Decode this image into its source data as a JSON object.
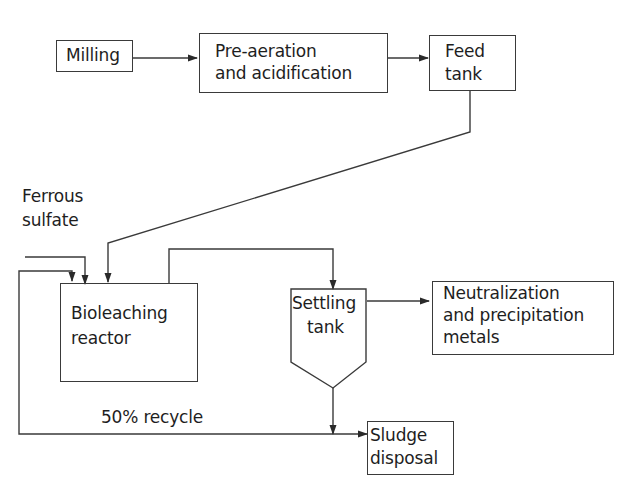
{
  "diagram": {
    "type": "process-flowchart",
    "nodes": [
      {
        "id": "milling",
        "lines": [
          "Milling"
        ]
      },
      {
        "id": "pre_aeration",
        "lines": [
          "Pre-aeration",
          "and acidification"
        ]
      },
      {
        "id": "feed_tank",
        "lines": [
          "Feed",
          "tank"
        ]
      },
      {
        "id": "bioleaching_reactor",
        "lines": [
          "Bioleaching",
          "reactor"
        ]
      },
      {
        "id": "settling_tank",
        "lines": [
          "Settling",
          "tank"
        ]
      },
      {
        "id": "neutralization",
        "lines": [
          "Neutralization",
          "and precipitation",
          "metals"
        ]
      },
      {
        "id": "sludge_disposal",
        "lines": [
          "Sludge",
          "disposal"
        ]
      }
    ],
    "inputs": [
      {
        "id": "ferrous_sulfate",
        "lines": [
          "Ferrous",
          "sulfate"
        ]
      }
    ],
    "edge_labels": {
      "recycle": "50% recycle"
    },
    "edges": [
      {
        "from": "milling",
        "to": "pre_aeration"
      },
      {
        "from": "pre_aeration",
        "to": "feed_tank"
      },
      {
        "from": "feed_tank",
        "to": "bioleaching_reactor"
      },
      {
        "from": "ferrous_sulfate",
        "to": "bioleaching_reactor"
      },
      {
        "from": "bioleaching_reactor",
        "to": "settling_tank"
      },
      {
        "from": "settling_tank",
        "to": "neutralization"
      },
      {
        "from": "settling_tank",
        "to": "sludge_disposal"
      },
      {
        "from": "settling_tank",
        "to": "bioleaching_reactor",
        "label": "50% recycle"
      }
    ]
  }
}
